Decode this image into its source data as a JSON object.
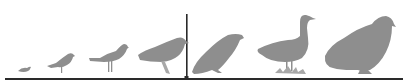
{
  "figure": {
    "colors": {
      "bird": "#8e8e8e",
      "line": "#2a2a2a",
      "background": "#ffffff"
    },
    "birds": [
      {
        "name": "tiny-bird",
        "x": 23
      },
      {
        "name": "small-songbird",
        "x": 63
      },
      {
        "name": "thrush",
        "x": 112
      },
      {
        "name": "crow",
        "x": 162
      },
      {
        "name": "hawk",
        "x": 220
      },
      {
        "name": "goose",
        "x": 297
      },
      {
        "name": "grouse",
        "x": 367
      }
    ],
    "divider_x": 187
  }
}
